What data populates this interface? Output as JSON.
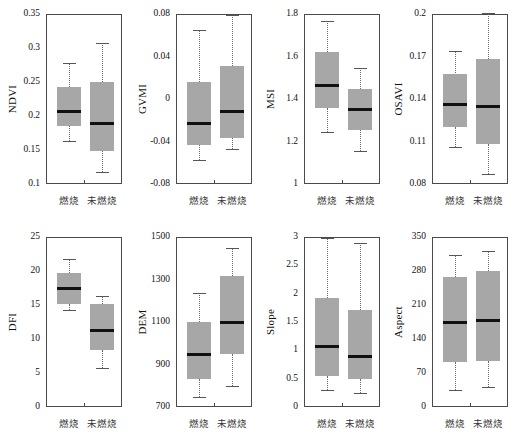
{
  "figure": {
    "title": "",
    "group_labels": [
      "燃烧",
      "未燃烧"
    ],
    "box_fill": "#a7a7a7",
    "median_color": "#111111",
    "frame_color": "#4a4a4a",
    "whisker_style": "dotted"
  },
  "chart_data": {
    "type": "box",
    "grid": false,
    "legend": "none",
    "categories": [
      "燃烧",
      "未燃烧"
    ],
    "panels": [
      {
        "ylabel": "NDVI",
        "ylim": [
          0.1,
          0.35
        ],
        "yticks": [
          0.35,
          0.3,
          0.25,
          0.2,
          0.15,
          0.1
        ],
        "ytick_labels": [
          "0.35",
          "0.3",
          "0.25",
          "0.2",
          "0.15",
          "0.1"
        ],
        "boxes": [
          {
            "group": "燃烧",
            "whisker_low": 0.163,
            "q1": 0.185,
            "median": 0.207,
            "q3": 0.243,
            "whisker_high": 0.278
          },
          {
            "group": "未燃烧",
            "whisker_low": 0.117,
            "q1": 0.149,
            "median": 0.189,
            "q3": 0.25,
            "whisker_high": 0.308
          }
        ]
      },
      {
        "ylabel": "GVMI",
        "ylim": [
          -0.08,
          0.08
        ],
        "yticks": [
          0.08,
          0.04,
          0,
          -0.04,
          -0.08
        ],
        "ytick_labels": [
          "0.08",
          "0.04",
          "0",
          "-0.04",
          "-0.08"
        ],
        "boxes": [
          {
            "group": "燃烧",
            "whisker_low": -0.057,
            "q1": -0.043,
            "median": -0.023,
            "q3": 0.016,
            "whisker_high": 0.065
          },
          {
            "group": "未燃烧",
            "whisker_low": -0.047,
            "q1": -0.037,
            "median": -0.012,
            "q3": 0.031,
            "whisker_high": 0.079
          }
        ]
      },
      {
        "ylabel": "MSI",
        "ylim": [
          1.0,
          1.8
        ],
        "yticks": [
          1.8,
          1.6,
          1.4,
          1.2,
          1.0
        ],
        "ytick_labels": [
          "1.8",
          "1.6",
          "1.4",
          "1.2",
          "1"
        ],
        "boxes": [
          {
            "group": "燃烧",
            "whisker_low": 1.245,
            "q1": 1.36,
            "median": 1.465,
            "q3": 1.62,
            "whisker_high": 1.765
          },
          {
            "group": "未燃烧",
            "whisker_low": 1.155,
            "q1": 1.255,
            "median": 1.35,
            "q3": 1.445,
            "whisker_high": 1.545
          }
        ]
      },
      {
        "ylabel": "OSAVI",
        "ylim": [
          0.08,
          0.2
        ],
        "yticks": [
          0.2,
          0.17,
          0.14,
          0.11,
          0.08
        ],
        "ytick_labels": [
          "0.2",
          "0.17",
          "0.14",
          "0.11",
          "0.08"
        ],
        "boxes": [
          {
            "group": "燃烧",
            "whisker_low": 0.106,
            "q1": 0.12,
            "median": 0.136,
            "q3": 0.158,
            "whisker_high": 0.174
          },
          {
            "group": "未燃烧",
            "whisker_low": 0.087,
            "q1": 0.108,
            "median": 0.135,
            "q3": 0.168,
            "whisker_high": 0.201
          }
        ]
      },
      {
        "ylabel": "DFI",
        "ylim": [
          0,
          25
        ],
        "yticks": [
          25,
          20,
          15,
          10,
          5,
          0
        ],
        "ytick_labels": [
          "25",
          "20",
          "15",
          "10",
          "5",
          "0"
        ],
        "boxes": [
          {
            "group": "燃烧",
            "whisker_low": 14.3,
            "q1": 15.2,
            "median": 17.5,
            "q3": 19.7,
            "whisker_high": 21.7
          },
          {
            "group": "未燃烧",
            "whisker_low": 5.8,
            "q1": 8.4,
            "median": 11.3,
            "q3": 15.1,
            "whisker_high": 16.3
          }
        ]
      },
      {
        "ylabel": "DEM",
        "ylim": [
          700,
          1500
        ],
        "yticks": [
          1500,
          1300,
          1100,
          900,
          700
        ],
        "ytick_labels": [
          "1500",
          "1300",
          "1100",
          "900",
          "700"
        ],
        "boxes": [
          {
            "group": "燃烧",
            "whisker_low": 745,
            "q1": 830,
            "median": 945,
            "q3": 1100,
            "whisker_high": 1235
          },
          {
            "group": "未燃烧",
            "whisker_low": 800,
            "q1": 950,
            "median": 1100,
            "q3": 1315,
            "whisker_high": 1450
          }
        ]
      },
      {
        "ylabel": "Slope",
        "ylim": [
          0,
          3
        ],
        "yticks": [
          3,
          2.5,
          2,
          1.5,
          1,
          0.5,
          0
        ],
        "ytick_labels": [
          "3",
          "2.5",
          "2",
          "1.5",
          "1",
          "0.5",
          "0"
        ],
        "boxes": [
          {
            "group": "燃烧",
            "whisker_low": 0.3,
            "q1": 0.54,
            "median": 1.06,
            "q3": 1.93,
            "whisker_high": 2.98
          },
          {
            "group": "未燃烧",
            "whisker_low": 0.25,
            "q1": 0.5,
            "median": 0.89,
            "q3": 1.72,
            "whisker_high": 2.9
          }
        ]
      },
      {
        "ylabel": "Aspect",
        "ylim": [
          0,
          350
        ],
        "yticks": [
          350,
          280,
          210,
          140,
          70,
          0
        ],
        "ytick_labels": [
          "350",
          "280",
          "210",
          "140",
          "70",
          "0"
        ],
        "boxes": [
          {
            "group": "燃烧",
            "whisker_low": 36,
            "q1": 92,
            "median": 175,
            "q3": 268,
            "whisker_high": 312
          },
          {
            "group": "未燃烧",
            "whisker_low": 42,
            "q1": 95,
            "median": 178,
            "q3": 280,
            "whisker_high": 322
          }
        ]
      }
    ]
  }
}
